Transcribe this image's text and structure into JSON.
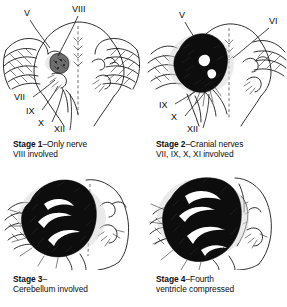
{
  "figure": {
    "background_color": "#ffffff",
    "ink_color": "#1a1a1a",
    "tumor_color": "#0d0d0d"
  },
  "panels": [
    {
      "id": "stage-1",
      "stage_label": "Stage 1",
      "caption_line1": "–Only nerve",
      "caption_line2": "VIII involved",
      "nerve_labels": [
        "V",
        "VIII",
        "VII",
        "IX",
        "X",
        "XII"
      ],
      "tumor_size": "small",
      "tumor_shading": "stippled"
    },
    {
      "id": "stage-2",
      "stage_label": "Stage 2",
      "caption_line1": "–Cranial nerves",
      "caption_line2": "VII, IX, X, XI involved",
      "nerve_labels": [
        "V",
        "VI",
        "IX",
        "X",
        "XII"
      ],
      "tumor_size": "medium",
      "tumor_shading": "solid-black"
    },
    {
      "id": "stage-3",
      "stage_label": "Stage 3",
      "caption_line1": "–",
      "caption_line2": "Cerebellum involved",
      "nerve_labels": [],
      "tumor_size": "large",
      "tumor_shading": "solid-black"
    },
    {
      "id": "stage-4",
      "stage_label": "Stage 4",
      "caption_line1": "–Fourth",
      "caption_line2": "ventricle compressed",
      "nerve_labels": [],
      "tumor_size": "very-large",
      "tumor_shading": "solid-black"
    }
  ]
}
